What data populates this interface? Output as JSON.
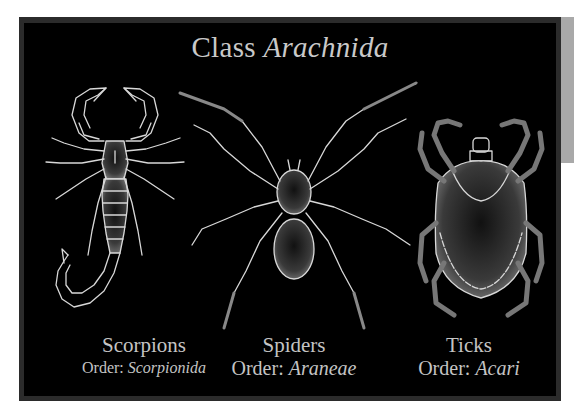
{
  "title": {
    "prefix": "Class",
    "taxon": "Arachnida"
  },
  "specimens": [
    {
      "name": "Scorpions",
      "order_label": "Order:",
      "order": "Scorpionida",
      "icon": "scorpion-illustration"
    },
    {
      "name": "Spiders",
      "order_label": "Order:",
      "order": "Araneae",
      "icon": "spider-illustration"
    },
    {
      "name": "Ticks",
      "order_label": "Order:",
      "order": "Acari",
      "icon": "tick-illustration"
    }
  ],
  "colors": {
    "panel": "#000000",
    "border": "#2b2b2b",
    "text": "#c9c9c9",
    "line_art": "#d8d8d8",
    "side_tab": "#a9a9a9"
  }
}
